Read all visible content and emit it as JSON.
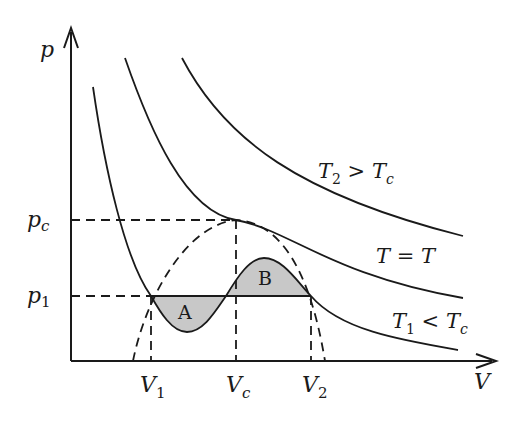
{
  "diagram": {
    "colors": {
      "ink": "#1a1a1a",
      "shade": "#c8c8c8",
      "background": "#ffffff"
    },
    "axes": {
      "y_label": "p",
      "x_label": "V",
      "y_ticks": [
        {
          "main": "p",
          "sub": "c"
        },
        {
          "main": "p",
          "sub": "1"
        }
      ],
      "x_ticks": [
        {
          "main": "V",
          "sub": "1"
        },
        {
          "main": "V",
          "sub": "c"
        },
        {
          "main": "V",
          "sub": "2"
        }
      ]
    },
    "curves": [
      {
        "id": "T2",
        "label_main": "T",
        "label_sub": "2",
        "label_rel": " > ",
        "label_rhs": "T",
        "label_rhs_sub": "c"
      },
      {
        "id": "Tc",
        "label": "T = T"
      },
      {
        "id": "T1",
        "label_main": "T",
        "label_sub": "1",
        "label_rel": " < ",
        "label_rhs": "T",
        "label_rhs_sub": "c"
      }
    ],
    "regions": [
      {
        "id": "A",
        "label": "A"
      },
      {
        "id": "B",
        "label": "B"
      }
    ]
  }
}
